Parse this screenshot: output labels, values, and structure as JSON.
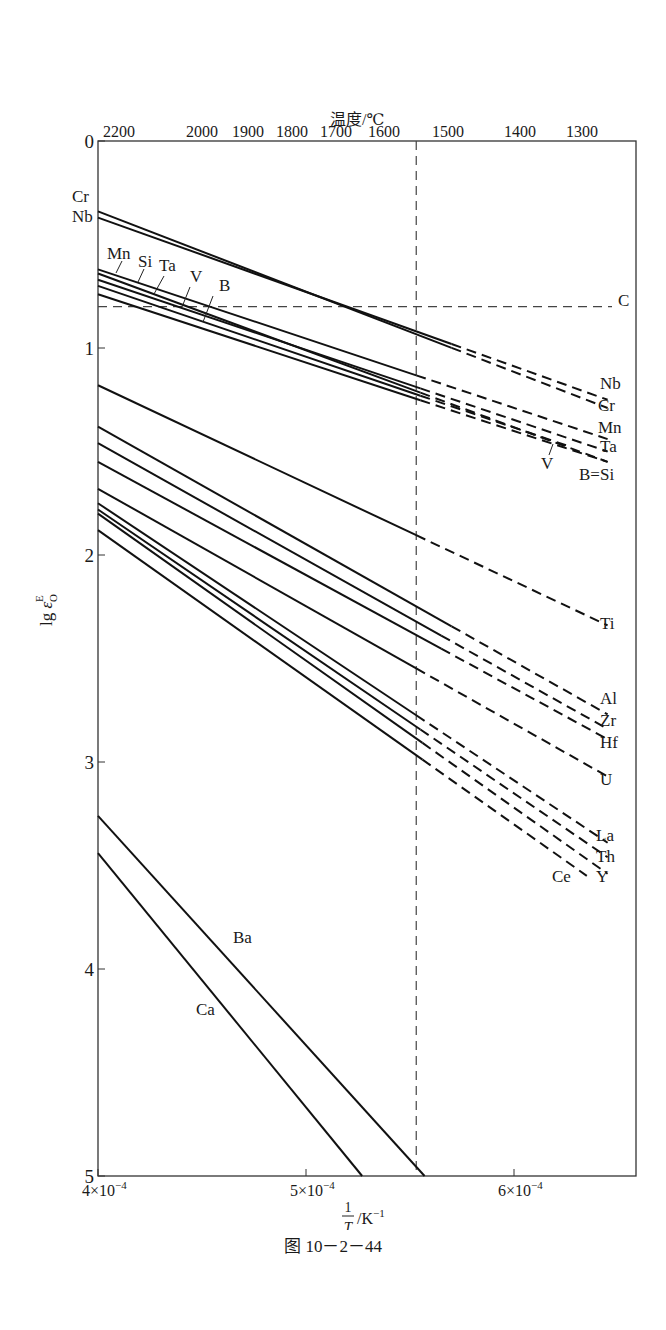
{
  "chart_data": {
    "type": "line",
    "title": "",
    "caption": "图 10－2－44",
    "xlabel": "1/T /K⁻¹",
    "ylabel": "lg ε_O^E",
    "x2label": "温度/℃",
    "xlim": [
      0.0004,
      0.000665
    ],
    "ylim": [
      0,
      5
    ],
    "y_inverted": true,
    "grid": false,
    "x_ticks": [
      {
        "value": 0.0004,
        "label": "4×10⁻⁴"
      },
      {
        "value": 0.0005,
        "label": "5×10⁻⁴"
      },
      {
        "value": 0.0006,
        "label": "6×10⁻⁴"
      }
    ],
    "y_ticks": [
      0,
      1,
      2,
      3,
      4,
      5
    ],
    "x2_ticks": [
      "2200",
      "2000",
      "1900",
      "1800",
      "1700",
      "1600",
      "1500",
      "1400",
      "1300"
    ],
    "reference_lines": [
      {
        "type": "vertical",
        "x": 0.000553,
        "style": "dashed",
        "note": "melting point of iron (~1536 ℃)"
      },
      {
        "type": "horizontal",
        "y": 0.8,
        "style": "dashed",
        "label": "C"
      }
    ],
    "series_note": "values are lg ε_O^E (plotted downward); solid portion to the left of solid_end, dashed extrapolation beyond",
    "series": [
      {
        "name": "Cr",
        "x": [
          0.0004,
          0.000645
        ],
        "y": [
          0.34,
          1.29
        ],
        "solid_end": 0.00057
      },
      {
        "name": "Nb",
        "x": [
          0.0004,
          0.000645
        ],
        "y": [
          0.37,
          1.25
        ],
        "solid_end": 0.00057
      },
      {
        "name": "Mn",
        "x": [
          0.0004,
          0.000645
        ],
        "y": [
          0.62,
          1.44
        ],
        "solid_end": 0.000553
      },
      {
        "name": "Si",
        "x": [
          0.0004,
          0.000645
        ],
        "y": [
          0.64,
          1.55
        ],
        "solid_end": 0.000555
      },
      {
        "name": "Ta",
        "x": [
          0.0004,
          0.000645
        ],
        "y": [
          0.67,
          1.5
        ],
        "solid_end": 0.000555
      },
      {
        "name": "V",
        "x": [
          0.0004,
          0.000625
        ],
        "y": [
          0.7,
          1.47
        ],
        "solid_end": 0.000555
      },
      {
        "name": "B",
        "x": [
          0.0004,
          0.000645
        ],
        "y": [
          0.74,
          1.55
        ],
        "solid_end": 0.000555
      },
      {
        "name": "Ti",
        "x": [
          0.0004,
          0.000645
        ],
        "y": [
          1.18,
          2.34
        ],
        "solid_end": 0.000553
      },
      {
        "name": "Al",
        "x": [
          0.0004,
          0.000645
        ],
        "y": [
          1.38,
          2.77
        ],
        "solid_end": 0.00057
      },
      {
        "name": "Zr",
        "x": [
          0.0004,
          0.000645
        ],
        "y": [
          1.46,
          2.84
        ],
        "solid_end": 0.000565
      },
      {
        "name": "Hf",
        "x": [
          0.0004,
          0.000645
        ],
        "y": [
          1.55,
          2.89
        ],
        "solid_end": 0.000565
      },
      {
        "name": "U",
        "x": [
          0.0004,
          0.000645
        ],
        "y": [
          1.68,
          3.07
        ],
        "solid_end": 0.000553
      },
      {
        "name": "La",
        "x": [
          0.0004,
          0.000645
        ],
        "y": [
          1.75,
          3.39
        ],
        "solid_end": 0.000553
      },
      {
        "name": "Th",
        "x": [
          0.0004,
          0.000645
        ],
        "y": [
          1.78,
          3.46
        ],
        "solid_end": 0.000555
      },
      {
        "name": "Y",
        "x": [
          0.0004,
          0.000645
        ],
        "y": [
          1.8,
          3.54
        ],
        "solid_end": 0.000556
      },
      {
        "name": "Ce",
        "x": [
          0.0004,
          0.000635
        ],
        "y": [
          1.88,
          3.55
        ],
        "solid_end": 0.000556
      },
      {
        "name": "Ba",
        "x": [
          0.0004,
          0.000557
        ],
        "y": [
          3.26,
          5.0
        ],
        "solid_end": 0.000557
      },
      {
        "name": "Ca",
        "x": [
          0.0004,
          0.000527
        ],
        "y": [
          3.44,
          5.0
        ],
        "solid_end": 0.000527
      }
    ],
    "right_labels": [
      "C",
      "Nb",
      "Cr",
      "Mn",
      "Ta",
      "V",
      "B=Si",
      "Ti",
      "Al",
      "Zr",
      "Hf",
      "U",
      "La",
      "Th",
      "Ce",
      "Y"
    ],
    "left_labels": [
      "Cr",
      "Nb",
      "Mn",
      "Si",
      "Ta",
      "V",
      "B"
    ],
    "inline_labels": [
      "Ba",
      "Ca"
    ]
  }
}
